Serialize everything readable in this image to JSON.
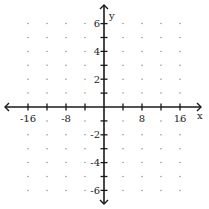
{
  "chart_data": {
    "type": "scatter",
    "title": "",
    "xlabel": "x",
    "ylabel": "y",
    "xlim": [
      -20,
      20
    ],
    "ylim": [
      -7,
      7
    ],
    "grid": "dots",
    "x_ticks": [
      -16,
      -12,
      -8,
      -4,
      4,
      8,
      12,
      16
    ],
    "x_tick_labels": [
      {
        "value": -16,
        "label": "-16"
      },
      {
        "value": -8,
        "label": "-8"
      },
      {
        "value": 8,
        "label": "8"
      },
      {
        "value": 16,
        "label": "16"
      }
    ],
    "y_ticks": [
      -6,
      -5,
      -4,
      -3,
      -2,
      -1,
      1,
      2,
      3,
      4,
      5,
      6
    ],
    "y_tick_labels": [
      {
        "value": 6,
        "label": "6"
      },
      {
        "value": 4,
        "label": "4"
      },
      {
        "value": 2,
        "label": "2"
      },
      {
        "value": -2,
        "label": "-2"
      },
      {
        "value": -4,
        "label": "-4"
      },
      {
        "value": -6,
        "label": "-6"
      }
    ],
    "grid_dots_x": [
      -16,
      -12,
      -8,
      -4,
      4,
      8,
      12,
      16
    ],
    "grid_dots_y": [
      -6,
      -5,
      -4,
      -3,
      -2,
      -1,
      1,
      2,
      3,
      4,
      5,
      6
    ],
    "series": [],
    "axis_arrows": true
  },
  "colors": {
    "axis": "#1a1a1a",
    "dot": "#8a8a8a",
    "background": "#ffffff"
  },
  "layout": {
    "origin_px": [
      104,
      107
    ],
    "px_per_x_unit": 4.75,
    "px_per_y_unit": 13.9,
    "x_axis_px": [
      5,
      201
    ],
    "y_axis_px": [
      5,
      204
    ]
  }
}
